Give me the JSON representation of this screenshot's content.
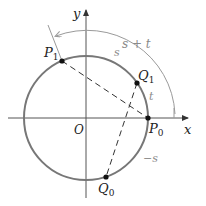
{
  "figure": {
    "colors": {
      "axis": "#555555",
      "circle": "#777777",
      "chord": "#333333",
      "arc_annotation": "#9a9a9a",
      "point": "#111111",
      "text": "#222222",
      "text_muted": "#8a8a8a"
    }
  },
  "axes": {
    "x_label": "x",
    "y_label": "y",
    "origin_label": "O"
  },
  "points": {
    "P0": {
      "name": "P",
      "sub": "0"
    },
    "P1": {
      "name": "P",
      "sub": "1"
    },
    "Q0": {
      "name": "Q",
      "sub": "0"
    },
    "Q1": {
      "name": "Q",
      "sub": "1"
    }
  },
  "arc_labels": {
    "s": "s",
    "t": "t",
    "s_plus_t": "s + t",
    "neg_s": "−s"
  }
}
